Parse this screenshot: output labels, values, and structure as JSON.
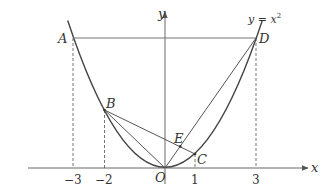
{
  "diagram": {
    "curve": {
      "equation": "y = x²",
      "label_main": "y = x",
      "label_sup": "2"
    },
    "axes": {
      "x_label": "x",
      "y_label": "y",
      "origin_label": "O"
    },
    "x_ticks": [
      "-3",
      "-2",
      "1",
      "3"
    ],
    "points": [
      {
        "name": "A",
        "x": -3,
        "y": 9
      },
      {
        "name": "B",
        "x": -2,
        "y": 4
      },
      {
        "name": "C",
        "x": 1,
        "y": 1
      },
      {
        "name": "D",
        "x": 3,
        "y": 9
      },
      {
        "name": "E",
        "x": 0.5,
        "y": 1.5
      },
      {
        "name": "O",
        "x": 0,
        "y": 0
      }
    ],
    "segments": [
      "AD",
      "OD",
      "BO",
      "BC",
      "BD"
    ],
    "dashed_lines": [
      "x=-3",
      "x=-2",
      "x=1",
      "x=3"
    ],
    "colors": {
      "stroke": "#555555",
      "text": "#333333"
    }
  },
  "labels": {
    "A": "A",
    "B": "B",
    "C": "C",
    "D": "D",
    "E": "E",
    "O": "O",
    "x": "x",
    "y": "y",
    "t_m3": "−3",
    "t_m2": "−2",
    "t_1": "1",
    "t_3": "3",
    "eq": "y = x",
    "eq_sup": "2"
  }
}
